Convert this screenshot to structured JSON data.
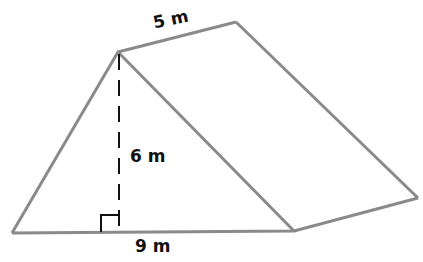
{
  "figure": {
    "type": "triangular prism",
    "labels": {
      "length": "5 m",
      "height": "6 m",
      "base": "9 m"
    },
    "colors": {
      "edge": "#8a8a8a",
      "height_line": "#111111",
      "text": "#111111"
    }
  }
}
